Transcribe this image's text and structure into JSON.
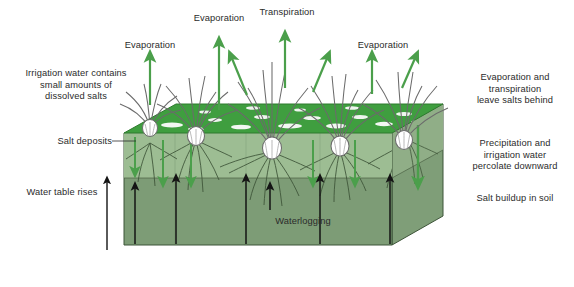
{
  "diagram": {
    "colors": {
      "grass_top": "#3f9e3f",
      "soil_upper": "#9dbd93",
      "soil_lower": "#7d9c76",
      "soil_side_left": "#8fae86",
      "soil_side_right": "#7f9e78",
      "green_arrow": "#4b9f4b",
      "black_arrow": "#1a1a1a",
      "text": "#2b2b2b",
      "plant_outline": "#6b6b6b",
      "salt_patch": "#f2f7f2",
      "root": "#3d5438"
    },
    "labels": {
      "evaporation_left": "Evaporation",
      "evaporation_mid": "Evaporation",
      "transpiration": "Transpiration",
      "evaporation_right": "Evaporation",
      "irrigation_note": "Irrigation water contains small amounts of dissolved salts",
      "irrigation_note_lines": [
        "Irrigation water contains",
        "small amounts of",
        "dissolved salts"
      ],
      "salt_deposits": "Salt deposits",
      "water_table_rises": "Water table rises",
      "waterlogging": "Waterlogging",
      "evap_transp_note_lines": [
        "Evaporation and",
        "transpiration",
        "leave salts behind"
      ],
      "percolate_note_lines": [
        "Precipitation and",
        "irrigation water",
        "percolate downward"
      ],
      "salt_buildup": "Salt buildup in soil"
    },
    "arrows": {
      "up_green_count": 7,
      "down_green_count": 5,
      "up_black_count": 6,
      "down_green_right_note": "one long green arrow on right face exterior"
    },
    "plants": {
      "count": 5,
      "description": "grass tufts with white bulbs and arching blades"
    }
  }
}
